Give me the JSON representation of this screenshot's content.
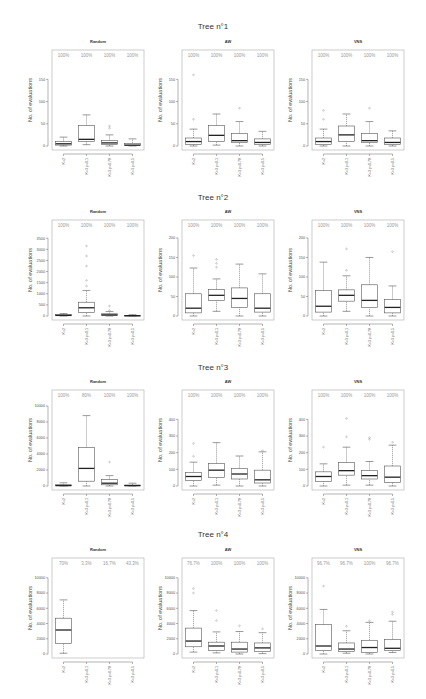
{
  "categories": [
    "K=2",
    "K=3 p=0.1",
    "K=3 p=0.78",
    "K=3 p=0.5"
  ],
  "ylabel": "No. of evaluations",
  "colors": {
    "box": "#555555",
    "median": "#222222",
    "pct": "#999999",
    "frame": "#aaaaaa",
    "outlier": "#888888"
  },
  "chart_data": [
    {
      "title": "Tree n°1",
      "type": "boxplot",
      "panels": [
        {
          "subtitle": "Random",
          "ylim": [
            0,
            180
          ],
          "yticks": [
            0,
            50,
            100,
            150
          ],
          "percent": [
            "100%",
            "100%",
            "100%",
            "100%"
          ],
          "boxes": [
            {
              "lo": 0,
              "q1": 2,
              "med": 5,
              "q3": 10,
              "hi": 20,
              "out": []
            },
            {
              "lo": 3,
              "q1": 10,
              "med": 15,
              "q3": 46,
              "hi": 70,
              "out": []
            },
            {
              "lo": 0,
              "q1": 3,
              "med": 7,
              "q3": 12,
              "hi": 25,
              "out": [
                40,
                45
              ]
            },
            {
              "lo": 0,
              "q1": 1,
              "med": 2,
              "q3": 6,
              "hi": 16,
              "out": []
            }
          ]
        },
        {
          "subtitle": "AW",
          "ylim": [
            0,
            180
          ],
          "yticks": [
            0,
            50,
            100,
            150
          ],
          "percent": [
            "100%",
            "100%",
            "100%",
            "100%"
          ],
          "boxes": [
            {
              "lo": 0,
              "q1": 3,
              "med": 10,
              "q3": 18,
              "hi": 38,
              "out": [
                60,
                160
              ]
            },
            {
              "lo": 2,
              "q1": 10,
              "med": 24,
              "q3": 46,
              "hi": 72,
              "out": []
            },
            {
              "lo": 0,
              "q1": 8,
              "med": 12,
              "q3": 28,
              "hi": 55,
              "out": [
                85
              ]
            },
            {
              "lo": 0,
              "q1": 3,
              "med": 8,
              "q3": 16,
              "hi": 33,
              "out": []
            }
          ]
        },
        {
          "subtitle": "VNS",
          "ylim": [
            0,
            180
          ],
          "yticks": [
            0,
            50,
            100,
            150
          ],
          "percent": [
            "100%",
            "100%",
            "100%",
            "100%"
          ],
          "boxes": [
            {
              "lo": 0,
              "q1": 3,
              "med": 10,
              "q3": 18,
              "hi": 38,
              "out": [
                60,
                80
              ]
            },
            {
              "lo": 0,
              "q1": 10,
              "med": 25,
              "q3": 45,
              "hi": 72,
              "out": []
            },
            {
              "lo": 0,
              "q1": 8,
              "med": 12,
              "q3": 28,
              "hi": 55,
              "out": [
                85
              ]
            },
            {
              "lo": 0,
              "q1": 3,
              "med": 8,
              "q3": 18,
              "hi": 34,
              "out": []
            }
          ]
        }
      ]
    },
    {
      "title": "Tree n°2",
      "type": "boxplot",
      "panels": [
        {
          "subtitle": "Random",
          "ylim": [
            0,
            3600
          ],
          "yticks": [
            0,
            500,
            1000,
            1500,
            2000,
            2500,
            3000,
            3500
          ],
          "percent": [
            "100%",
            "100%",
            "100%",
            "100%"
          ],
          "boxes": [
            {
              "lo": 0,
              "q1": 10,
              "med": 30,
              "q3": 60,
              "hi": 110,
              "out": []
            },
            {
              "lo": 0,
              "q1": 160,
              "med": 370,
              "q3": 620,
              "hi": 1150,
              "out": [
                1350,
                1600,
                2250,
                2700,
                3150
              ]
            },
            {
              "lo": 0,
              "q1": 20,
              "med": 50,
              "q3": 100,
              "hi": 200,
              "out": [
                250,
                450
              ]
            },
            {
              "lo": 0,
              "q1": 5,
              "med": 15,
              "q3": 30,
              "hi": 60,
              "out": []
            }
          ]
        },
        {
          "subtitle": "AW",
          "ylim": [
            0,
            205
          ],
          "yticks": [
            0,
            50,
            100,
            150,
            200
          ],
          "percent": [
            "100%",
            "100%",
            "100%",
            "100%"
          ],
          "boxes": [
            {
              "lo": 0,
              "q1": 8,
              "med": 20,
              "q3": 57,
              "hi": 123,
              "out": [
                155
              ]
            },
            {
              "lo": 12,
              "q1": 40,
              "med": 53,
              "q3": 68,
              "hi": 95,
              "out": [
                125,
                135,
                145
              ]
            },
            {
              "lo": 0,
              "q1": 22,
              "med": 45,
              "q3": 72,
              "hi": 133,
              "out": []
            },
            {
              "lo": 0,
              "q1": 10,
              "med": 20,
              "q3": 57,
              "hi": 108,
              "out": []
            }
          ]
        },
        {
          "subtitle": "VNS",
          "ylim": [
            0,
            205
          ],
          "yticks": [
            0,
            50,
            100,
            150,
            200
          ],
          "percent": [
            "100%",
            "100%",
            "100%",
            "100%"
          ],
          "boxes": [
            {
              "lo": 0,
              "q1": 10,
              "med": 25,
              "q3": 65,
              "hi": 138,
              "out": []
            },
            {
              "lo": 12,
              "q1": 38,
              "med": 53,
              "q3": 67,
              "hi": 103,
              "out": [
                117,
                172
              ]
            },
            {
              "lo": 0,
              "q1": 22,
              "med": 40,
              "q3": 80,
              "hi": 150,
              "out": []
            },
            {
              "lo": 0,
              "q1": 8,
              "med": 22,
              "q3": 42,
              "hi": 77,
              "out": [
                165
              ]
            }
          ]
        }
      ]
    },
    {
      "title": "Tree n°3",
      "type": "boxplot",
      "panels": [
        {
          "subtitle": "Random",
          "ylim": [
            0,
            10000
          ],
          "yticks": [
            0,
            2000,
            4000,
            6000,
            8000,
            10000
          ],
          "percent": [
            "100%",
            "80%",
            "100%",
            "100%"
          ],
          "boxes": [
            {
              "lo": 0,
              "q1": 20,
              "med": 60,
              "q3": 150,
              "hi": 400,
              "out": []
            },
            {
              "lo": 0,
              "q1": 600,
              "med": 2200,
              "q3": 4800,
              "hi": 8800,
              "out": []
            },
            {
              "lo": 0,
              "q1": 150,
              "med": 350,
              "q3": 800,
              "hi": 1300,
              "out": [
                3000
              ]
            },
            {
              "lo": 0,
              "q1": 20,
              "med": 50,
              "q3": 120,
              "hi": 350,
              "out": []
            }
          ]
        },
        {
          "subtitle": "AW",
          "ylim": [
            0,
            480
          ],
          "yticks": [
            0,
            100,
            200,
            300,
            400
          ],
          "percent": [
            "100%",
            "100%",
            "100%",
            "100%"
          ],
          "boxes": [
            {
              "lo": 0,
              "q1": 33,
              "med": 57,
              "q3": 80,
              "hi": 143,
              "out": [
                178,
                255
              ]
            },
            {
              "lo": 5,
              "q1": 52,
              "med": 95,
              "q3": 135,
              "hi": 260,
              "out": []
            },
            {
              "lo": 0,
              "q1": 42,
              "med": 72,
              "q3": 105,
              "hi": 180,
              "out": []
            },
            {
              "lo": 0,
              "q1": 18,
              "med": 37,
              "q3": 95,
              "hi": 205,
              "out": [
                212
              ]
            }
          ]
        },
        {
          "subtitle": "VNS",
          "ylim": [
            0,
            480
          ],
          "yticks": [
            0,
            100,
            200,
            300,
            400
          ],
          "percent": [
            "100%",
            "100%",
            "100%",
            "100%"
          ],
          "boxes": [
            {
              "lo": 0,
              "q1": 28,
              "med": 57,
              "q3": 85,
              "hi": 133,
              "out": [
                233
              ]
            },
            {
              "lo": 5,
              "q1": 65,
              "med": 92,
              "q3": 140,
              "hi": 233,
              "out": [
                295,
                405
              ]
            },
            {
              "lo": 5,
              "q1": 42,
              "med": 62,
              "q3": 92,
              "hi": 147,
              "out": [
                280,
                290
              ]
            },
            {
              "lo": 0,
              "q1": 22,
              "med": 53,
              "q3": 120,
              "hi": 245,
              "out": [
                262
              ]
            }
          ]
        }
      ]
    },
    {
      "title": "Tree n°4",
      "type": "boxplot",
      "panels": [
        {
          "subtitle": "Random",
          "ylim": [
            0,
            10500
          ],
          "yticks": [
            0,
            2000,
            4000,
            6000,
            8000,
            10000
          ],
          "percent": [
            "70%",
            "3.3%",
            "16.7%",
            "43.3%"
          ],
          "boxes": [
            {
              "lo": 100,
              "q1": 1400,
              "med": 3150,
              "q3": 4700,
              "hi": 7100,
              "out": []
            },
            null,
            null,
            null
          ]
        },
        {
          "subtitle": "AW",
          "ylim": [
            0,
            10500
          ],
          "yticks": [
            0,
            2000,
            4000,
            6000,
            8000,
            10000
          ],
          "percent": [
            "76.7%",
            "100%",
            "100%",
            "100%"
          ],
          "boxes": [
            {
              "lo": 250,
              "q1": 950,
              "med": 1700,
              "q3": 3400,
              "hi": 5700,
              "out": [
                8000,
                8600
              ]
            },
            {
              "lo": 150,
              "q1": 450,
              "med": 1050,
              "q3": 1550,
              "hi": 2900,
              "out": [
                4400,
                5700
              ]
            },
            {
              "lo": 0,
              "q1": 250,
              "med": 650,
              "q3": 1550,
              "hi": 2950,
              "out": [
                3700
              ]
            },
            {
              "lo": 50,
              "q1": 350,
              "med": 800,
              "q3": 1450,
              "hi": 2800,
              "out": [
                3300
              ]
            }
          ]
        },
        {
          "subtitle": "VNS",
          "ylim": [
            0,
            10500
          ],
          "yticks": [
            0,
            2000,
            4000,
            6000,
            8000,
            10000
          ],
          "percent": [
            "96.7%",
            "96.7%",
            "100%",
            "96.7%"
          ],
          "boxes": [
            {
              "lo": 0,
              "q1": 450,
              "med": 1050,
              "q3": 3850,
              "hi": 5850,
              "out": [
                8900
              ]
            },
            {
              "lo": 100,
              "q1": 350,
              "med": 650,
              "q3": 1450,
              "hi": 3050,
              "out": [
                3650
              ]
            },
            {
              "lo": 0,
              "q1": 200,
              "med": 850,
              "q3": 1800,
              "hi": 4150,
              "out": [
                4350
              ]
            },
            {
              "lo": 200,
              "q1": 450,
              "med": 750,
              "q3": 1900,
              "hi": 4300,
              "out": [
                5200,
                5500
              ]
            }
          ]
        }
      ]
    }
  ]
}
